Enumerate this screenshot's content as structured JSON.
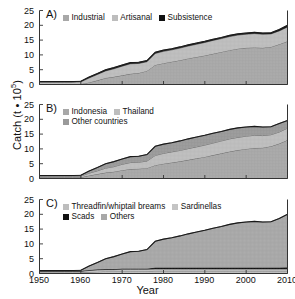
{
  "figure": {
    "ylabel_text": "Catch (t • 10",
    "ylabel_exp": "5",
    "ylabel_close": ")",
    "xlabel": "Year"
  },
  "axes": {
    "yticks": [
      0,
      5,
      10,
      15,
      20,
      25
    ],
    "xticks": [
      1950,
      1960,
      1970,
      1980,
      1990,
      2000,
      2010
    ],
    "ylim": [
      0,
      25
    ],
    "xlim": [
      1950,
      2010
    ]
  },
  "colors": {
    "band_light": "#c9c9c9",
    "band_mid": "#a8a8a8",
    "band_dark": "#8d8d8d",
    "band_black": "#111111",
    "axis": "#333333",
    "line": "#4a4a4a"
  },
  "panels": [
    {
      "tag": "A)",
      "legend_rows": [
        [
          {
            "label": "Industrial",
            "swatch": "#a8a8a8"
          },
          {
            "label": "Artisanal",
            "swatch": "#bdbdbd"
          },
          {
            "label": "Subsistence",
            "swatch": "#111111"
          }
        ]
      ]
    },
    {
      "tag": "B)",
      "legend_rows": [
        [
          {
            "label": "Indonesia",
            "swatch": "#a8a8a8"
          },
          {
            "label": "Thailand",
            "swatch": "#bdbdbd"
          }
        ],
        [
          {
            "label": "Other countries",
            "swatch": "#9a9a9a"
          }
        ]
      ]
    },
    {
      "tag": "C)",
      "legend_rows": [
        [
          {
            "label": "Threadfin/whiptail breams",
            "swatch": "#bdbdbd"
          },
          {
            "label": "Sardinellas",
            "swatch": "#c4c4c4"
          }
        ],
        [
          {
            "label": "Scads",
            "swatch": "#111111"
          },
          {
            "label": "Others",
            "swatch": "#a8a8a8"
          }
        ]
      ]
    }
  ],
  "chart_data": {
    "type": "area",
    "title": "",
    "xlabel": "Year",
    "ylabel": "Catch (t • 10^5)",
    "xlim": [
      1950,
      2010
    ],
    "ylim": [
      0,
      25
    ],
    "xticks": [
      1950,
      1960,
      1970,
      1980,
      1990,
      2000,
      2010
    ],
    "yticks": [
      0,
      5,
      10,
      15,
      20,
      25
    ],
    "grid": false,
    "stacked": true,
    "legend_position": "inside top-left",
    "x": [
      1950,
      1952,
      1954,
      1956,
      1958,
      1960,
      1962,
      1964,
      1966,
      1968,
      1970,
      1972,
      1974,
      1976,
      1978,
      1980,
      1982,
      1984,
      1986,
      1988,
      1990,
      1992,
      1994,
      1996,
      1998,
      2000,
      2002,
      2004,
      2006,
      2008,
      2010
    ],
    "panels": [
      {
        "tag": "A)",
        "series": [
          {
            "name": "Industrial",
            "values": [
              0.1,
              0.1,
              0.1,
              0.1,
              0.1,
              0.2,
              0.7,
              1.4,
              2.2,
              2.6,
              3.1,
              3.6,
              3.9,
              4.6,
              6.6,
              7.2,
              7.7,
              8.2,
              8.8,
              9.3,
              9.8,
              10.4,
              11.0,
              11.6,
              12.1,
              12.4,
              12.5,
              12.4,
              12.7,
              13.6,
              14.6
            ]
          },
          {
            "name": "Artisanal",
            "values": [
              0.7,
              0.7,
              0.7,
              0.7,
              0.7,
              0.7,
              1.5,
              2.0,
              2.4,
              2.7,
              3.1,
              3.4,
              3.2,
              3.1,
              3.9,
              4.0,
              4.0,
              4.1,
              4.2,
              4.3,
              4.4,
              4.5,
              4.5,
              4.6,
              4.6,
              4.6,
              4.7,
              4.6,
              4.4,
              4.5,
              4.8
            ]
          },
          {
            "name": "Subsistence",
            "values": [
              0.2,
              0.2,
              0.2,
              0.2,
              0.2,
              0.2,
              0.3,
              0.3,
              0.4,
              0.4,
              0.4,
              0.4,
              0.4,
              0.4,
              0.4,
              0.4,
              0.4,
              0.4,
              0.4,
              0.4,
              0.4,
              0.4,
              0.4,
              0.4,
              0.4,
              0.4,
              0.4,
              0.4,
              0.4,
              0.5,
              0.6
            ]
          }
        ],
        "totals": [
          1.0,
          1.0,
          1.0,
          1.0,
          1.0,
          1.1,
          2.5,
          3.7,
          5.0,
          5.7,
          6.6,
          7.4,
          7.5,
          8.1,
          10.9,
          11.6,
          12.1,
          12.7,
          13.4,
          14.0,
          14.6,
          15.3,
          15.9,
          16.6,
          17.1,
          17.4,
          17.6,
          17.4,
          17.5,
          18.6,
          20.0
        ]
      },
      {
        "tag": "B)",
        "series": [
          {
            "name": "Indonesia",
            "values": [
              0.4,
              0.4,
              0.4,
              0.4,
              0.4,
              0.4,
              1.0,
              1.5,
              2.0,
              2.3,
              2.8,
              3.2,
              3.3,
              3.5,
              4.5,
              5.0,
              5.4,
              5.8,
              6.3,
              6.8,
              7.3,
              7.9,
              8.5,
              9.1,
              9.6,
              10.0,
              10.3,
              10.4,
              10.9,
              11.8,
              13.0
            ]
          },
          {
            "name": "Thailand",
            "values": [
              0.3,
              0.3,
              0.3,
              0.3,
              0.3,
              0.4,
              0.8,
              1.1,
              1.5,
              1.7,
              2.0,
              2.2,
              2.2,
              2.4,
              3.3,
              3.5,
              3.6,
              3.7,
              3.8,
              3.9,
              4.0,
              4.1,
              4.2,
              4.3,
              4.3,
              4.3,
              4.3,
              4.1,
              3.9,
              3.9,
              4.0
            ]
          },
          {
            "name": "Other countries",
            "values": [
              0.3,
              0.3,
              0.3,
              0.3,
              0.3,
              0.3,
              0.7,
              1.1,
              1.5,
              1.7,
              1.8,
              2.0,
              2.0,
              2.2,
              3.1,
              3.1,
              3.1,
              3.2,
              3.3,
              3.3,
              3.3,
              3.3,
              3.2,
              3.2,
              3.2,
              3.1,
              3.0,
              2.9,
              2.7,
              2.9,
              2.6
            ]
          }
        ],
        "totals": [
          1.0,
          1.0,
          1.0,
          1.0,
          1.0,
          1.1,
          2.5,
          3.7,
          5.0,
          5.7,
          6.6,
          7.4,
          7.5,
          8.1,
          10.9,
          11.6,
          12.1,
          12.7,
          13.4,
          14.0,
          14.6,
          15.3,
          15.9,
          16.6,
          17.1,
          17.4,
          17.6,
          17.4,
          17.5,
          18.6,
          19.6
        ]
      },
      {
        "tag": "C)",
        "series": [
          {
            "name": "Threadfin/whiptail breams",
            "values": [
              0.3,
              0.3,
              0.3,
              0.3,
              0.3,
              0.3,
              0.5,
              0.6,
              0.7,
              0.7,
              0.8,
              0.8,
              0.8,
              0.8,
              0.9,
              0.9,
              0.9,
              0.9,
              0.9,
              0.9,
              0.9,
              0.9,
              0.9,
              0.9,
              0.9,
              0.9,
              0.9,
              0.9,
              0.9,
              0.9,
              0.9
            ]
          },
          {
            "name": "Sardinellas",
            "values": [
              0.4,
              0.4,
              0.4,
              0.4,
              0.4,
              0.4,
              0.5,
              0.6,
              0.6,
              0.6,
              0.6,
              0.6,
              0.6,
              0.6,
              0.6,
              0.6,
              0.6,
              0.6,
              0.6,
              0.6,
              0.6,
              0.6,
              0.6,
              0.6,
              0.6,
              0.6,
              0.6,
              0.6,
              0.6,
              0.6,
              0.6
            ]
          },
          {
            "name": "Scads",
            "values": [
              0.2,
              0.2,
              0.2,
              0.2,
              0.2,
              0.2,
              0.2,
              0.2,
              0.2,
              0.2,
              0.3,
              0.3,
              0.3,
              0.3,
              0.5,
              0.5,
              0.5,
              0.5,
              0.5,
              0.5,
              0.5,
              0.5,
              0.5,
              0.5,
              0.5,
              0.5,
              0.5,
              0.5,
              0.5,
              0.5,
              0.6
            ]
          },
          {
            "name": "Others",
            "values": [
              0.1,
              0.1,
              0.1,
              0.1,
              0.1,
              0.2,
              1.3,
              2.3,
              3.5,
              4.2,
              4.9,
              5.7,
              5.8,
              6.4,
              8.9,
              9.6,
              10.1,
              10.7,
              11.4,
              12.0,
              12.6,
              13.3,
              13.9,
              14.6,
              15.1,
              15.4,
              15.6,
              15.4,
              15.5,
              16.6,
              17.9
            ]
          }
        ],
        "totals": [
          1.0,
          1.0,
          1.0,
          1.0,
          1.0,
          1.1,
          2.5,
          3.7,
          5.0,
          5.7,
          6.6,
          7.4,
          7.5,
          8.1,
          10.9,
          11.6,
          12.1,
          12.7,
          13.4,
          14.0,
          14.6,
          15.3,
          15.9,
          16.6,
          17.1,
          17.4,
          17.6,
          17.4,
          17.5,
          18.6,
          20.0
        ]
      }
    ]
  }
}
